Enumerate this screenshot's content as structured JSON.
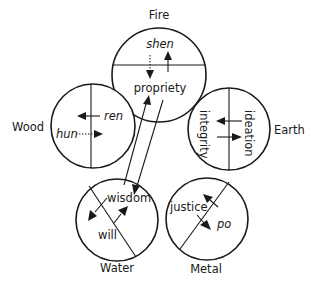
{
  "diagram": {
    "type": "five-phases-correspondence",
    "colors": {
      "ink": "#1a1a1a",
      "background": "#ffffff"
    },
    "elements": [
      {
        "id": "fire",
        "label": "Fire",
        "upper": "shen",
        "lower": "propriety",
        "upper_italic": true
      },
      {
        "id": "wood",
        "label": "Wood",
        "right": "ren",
        "left": "hun",
        "italic": true
      },
      {
        "id": "earth",
        "label": "Earth",
        "left": "integrity",
        "right": "ideation"
      },
      {
        "id": "water",
        "label": "Water",
        "upper": "wisdom",
        "lower": "will"
      },
      {
        "id": "metal",
        "label": "Metal",
        "left": "justice",
        "right": "po",
        "right_italic": true
      }
    ],
    "connections": [
      {
        "from": "water",
        "to": "fire",
        "label": "wisdom to propriety (arrow up)"
      },
      {
        "from": "fire",
        "to": "water",
        "label": "propriety to wisdom (arrow down)"
      }
    ]
  }
}
